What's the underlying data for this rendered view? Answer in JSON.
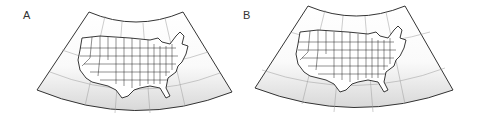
{
  "panels": [
    {
      "label": "A",
      "description": "Conterminous United States on conic projection with graticule"
    },
    {
      "label": "B",
      "description": "Conterminous United States on conic projection with graticule"
    }
  ],
  "colors": {
    "outline": "#333333",
    "graticule": "#9a9a9a",
    "state_borders": "#222222",
    "fill_top": "#ffffff",
    "fill_bottom": "#dcdcdc"
  }
}
